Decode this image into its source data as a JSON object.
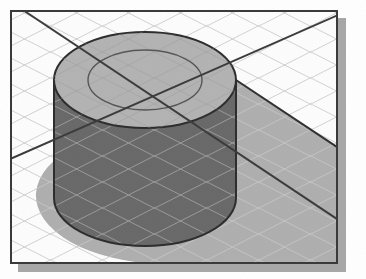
{
  "canvas": {
    "width": 366,
    "height": 279,
    "background_color": "#ffffff",
    "title": "Isometric cylinder on grid floor"
  },
  "frame": {
    "name": "image-frame",
    "x": 10,
    "y": 10,
    "width": 328,
    "height": 254,
    "border_color": "#3a3a3a",
    "border_width": 2,
    "fill_color": "#ffffff",
    "drop_shadow": {
      "offset_x": 7,
      "offset_y": 7,
      "color": "#a8a8a8"
    }
  },
  "grid": {
    "name": "isometric-grid",
    "line_color": "#d2d2d2",
    "line_width": 1,
    "spacing": 26,
    "angle_up_deg": 27,
    "angle_down_deg": -27,
    "description": "light gray isometric diamond floor grid"
  },
  "cylinder": {
    "name": "cylinder-solid",
    "center_x": 145,
    "center_y": 80,
    "top_rx": 91,
    "top_ry": 48,
    "bore_rx": 57,
    "bore_ry": 30,
    "height": 118,
    "top_fill": "#b4b4b4",
    "body_fill": "#6a6a6a",
    "outline_color": "#2e2e2e",
    "outline_width": 2,
    "bore_outline_color": "#575757",
    "bore_outline_width": 1.4
  },
  "shadow": {
    "name": "cast-shadow",
    "fill_color": "#b0b0b0",
    "edge_color": "#303030",
    "edge_width": 2,
    "direction": "lower-right"
  },
  "axes": {
    "name": "axis-crosshair-lines",
    "color": "#3c3c3c",
    "width": 2,
    "intersection_x": 145,
    "intersection_y": 80,
    "lines": [
      {
        "label": "axis-line-descending",
        "x1": 26,
        "y1": 12,
        "x2": 352,
        "y2": 229
      },
      {
        "label": "axis-line-ascending",
        "x1": 10,
        "y1": 160,
        "x2": 345,
        "y2": 12
      }
    ]
  },
  "noise": {
    "name": "scan-texture",
    "opacity": 0.06,
    "description": "faint scanned paper grain over the whole image"
  }
}
